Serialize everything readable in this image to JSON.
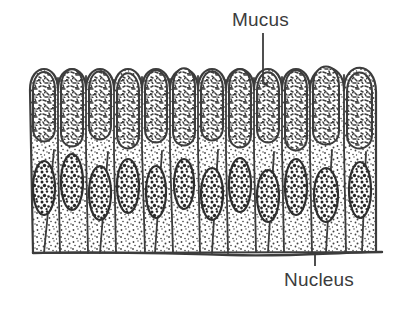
{
  "figure": {
    "background_color": "#ffffff",
    "ink_color": "#3c3c3c",
    "stipple_color": "#4a4a4a",
    "width": 405,
    "height": 319
  },
  "labels": {
    "mucus": {
      "text": "Mucus",
      "x": 232,
      "y": 10,
      "font_size": 19,
      "color": "#3c3c3c"
    },
    "nucleus": {
      "text": "Nucleus",
      "x": 284,
      "y": 270,
      "font_size": 19,
      "color": "#3c3c3c"
    }
  },
  "leader_lines": {
    "mucus": {
      "name": "mucus-leader-line",
      "x1": 263,
      "y1": 33,
      "x2": 263,
      "y2": 86,
      "arrow": "down"
    },
    "nucleus": {
      "name": "nucleus-leader-line",
      "x1": 315,
      "y1": 266,
      "x2": 315,
      "y2": 252,
      "arrow": "none"
    }
  },
  "diagram": {
    "epithelium": {
      "left": 30,
      "right": 376,
      "apex_y": 57,
      "base_y": 253,
      "cell_count": 12,
      "cell_width": 29
    },
    "mucus_zone": {
      "top": 57,
      "bottom": 148
    },
    "nucleus_zone": {
      "top": 150,
      "bottom": 218
    },
    "basement_membrane": {
      "y": 253,
      "left": 33,
      "right": 382
    },
    "cells": [
      {
        "index": 0,
        "x_left": 30,
        "x_right": 58,
        "apex": 62,
        "mucus_bottom": 143,
        "nucleus_cx": 44,
        "nucleus_cy": 188,
        "nucleus_rx": 11,
        "nucleus_ry": 27,
        "base_left": 37,
        "base_right": 60
      },
      {
        "index": 1,
        "x_left": 58,
        "x_right": 86,
        "apex": 58,
        "mucus_bottom": 148,
        "nucleus_cx": 72,
        "nucleus_cy": 182,
        "nucleus_rx": 11,
        "nucleus_ry": 28,
        "base_left": 62,
        "base_right": 85
      },
      {
        "index": 2,
        "x_left": 86,
        "x_right": 114,
        "apex": 60,
        "mucus_bottom": 140,
        "nucleus_cx": 100,
        "nucleus_cy": 193,
        "nucleus_rx": 11,
        "nucleus_ry": 27,
        "base_left": 88,
        "base_right": 112
      },
      {
        "index": 3,
        "x_left": 114,
        "x_right": 142,
        "apex": 63,
        "mucus_bottom": 150,
        "nucleus_cx": 128,
        "nucleus_cy": 186,
        "nucleus_rx": 11,
        "nucleus_ry": 27,
        "base_left": 116,
        "base_right": 140
      },
      {
        "index": 4,
        "x_left": 142,
        "x_right": 170,
        "apex": 60,
        "mucus_bottom": 143,
        "nucleus_cx": 156,
        "nucleus_cy": 192,
        "nucleus_rx": 10,
        "nucleus_ry": 26,
        "base_left": 145,
        "base_right": 168
      },
      {
        "index": 5,
        "x_left": 170,
        "x_right": 198,
        "apex": 58,
        "mucus_bottom": 147,
        "nucleus_cx": 184,
        "nucleus_cy": 184,
        "nucleus_rx": 10,
        "nucleus_ry": 25,
        "base_left": 173,
        "base_right": 196
      },
      {
        "index": 6,
        "x_left": 198,
        "x_right": 226,
        "apex": 61,
        "mucus_bottom": 141,
        "nucleus_cx": 212,
        "nucleus_cy": 194,
        "nucleus_rx": 11,
        "nucleus_ry": 26,
        "base_left": 200,
        "base_right": 224
      },
      {
        "index": 7,
        "x_left": 226,
        "x_right": 254,
        "apex": 59,
        "mucus_bottom": 149,
        "nucleus_cx": 240,
        "nucleus_cy": 185,
        "nucleus_rx": 11,
        "nucleus_ry": 27,
        "base_left": 228,
        "base_right": 252
      },
      {
        "index": 8,
        "x_left": 254,
        "x_right": 282,
        "apex": 62,
        "mucus_bottom": 144,
        "nucleus_cx": 268,
        "nucleus_cy": 196,
        "nucleus_rx": 11,
        "nucleus_ry": 26,
        "base_left": 256,
        "base_right": 280
      },
      {
        "index": 9,
        "x_left": 282,
        "x_right": 310,
        "apex": 60,
        "mucus_bottom": 152,
        "nucleus_cx": 296,
        "nucleus_cy": 187,
        "nucleus_rx": 11,
        "nucleus_ry": 28,
        "base_left": 284,
        "base_right": 308
      },
      {
        "index": 10,
        "x_left": 310,
        "x_right": 344,
        "apex": 57,
        "mucus_bottom": 146,
        "nucleus_cx": 326,
        "nucleus_cy": 195,
        "nucleus_rx": 12,
        "nucleus_ry": 27,
        "base_left": 312,
        "base_right": 344
      },
      {
        "index": 11,
        "x_left": 344,
        "x_right": 376,
        "apex": 63,
        "mucus_bottom": 150,
        "nucleus_cx": 360,
        "nucleus_cy": 190,
        "nucleus_rx": 11,
        "nucleus_ry": 28,
        "base_left": 346,
        "base_right": 376
      }
    ]
  }
}
